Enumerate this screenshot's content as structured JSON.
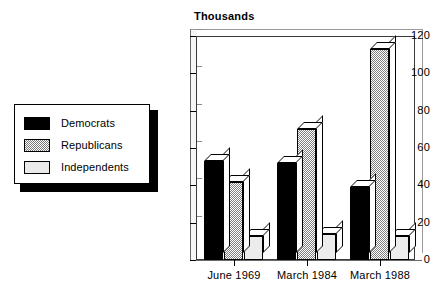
{
  "legend": {
    "items": [
      {
        "label": "Democrats",
        "swatch": "black-solid",
        "color": "#000000"
      },
      {
        "label": "Republicans",
        "swatch": "gray-hatch",
        "color": "#808080"
      },
      {
        "label": "Independents",
        "swatch": "light-gray",
        "color": "#ececec"
      }
    ]
  },
  "chart_data": {
    "type": "bar",
    "title": "",
    "ylabel": "Thousands",
    "xlabel": "",
    "categories": [
      "June 1969",
      "March 1984",
      "March 1988"
    ],
    "series": [
      {
        "name": "Democrats",
        "values": [
          53,
          52,
          39
        ]
      },
      {
        "name": "Republicans",
        "values": [
          42,
          70,
          113
        ]
      },
      {
        "name": "Independents",
        "values": [
          13,
          14,
          13
        ]
      }
    ],
    "ylim": [
      0,
      120
    ],
    "yticks": [
      0,
      20,
      40,
      60,
      80,
      100,
      120
    ],
    "ytick_labels": [
      "0",
      "20",
      "40",
      "60",
      "80",
      "100",
      "120"
    ],
    "grid": false,
    "legend_position": "left-outside",
    "style": "3d-bars"
  }
}
